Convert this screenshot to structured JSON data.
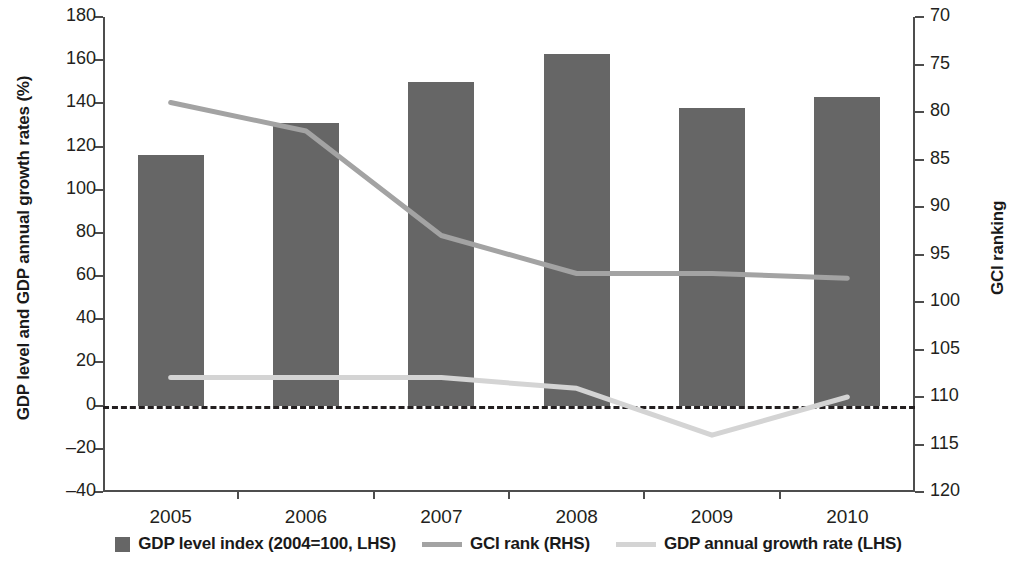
{
  "chart_data": {
    "type": "bar",
    "title": "",
    "subtitle": "",
    "categories": [
      "2005",
      "2006",
      "2007",
      "2008",
      "2009",
      "2010"
    ],
    "xlabel": "",
    "ylabel": "GDP level and GDP annual growth rates (%)",
    "y2label": "GCI ranking",
    "ylim": [
      -40,
      180
    ],
    "yticks": [
      -40,
      -20,
      0,
      20,
      40,
      60,
      80,
      100,
      120,
      140,
      160,
      180
    ],
    "ytick_labels": [
      "–40",
      "–20",
      "0",
      "20",
      "40",
      "60",
      "80",
      "100",
      "120",
      "140",
      "160",
      "180"
    ],
    "y2lim": [
      70,
      120
    ],
    "y2_inverted": true,
    "y2ticks": [
      70,
      75,
      80,
      85,
      90,
      95,
      100,
      105,
      110,
      115,
      120
    ],
    "y2tick_labels": [
      "70",
      "75",
      "80",
      "85",
      "90",
      "95",
      "100",
      "105",
      "110",
      "115",
      "120"
    ],
    "grid": false,
    "legend_position": "bottom",
    "zero_reference_line": true,
    "series": [
      {
        "name": "GDP level index (2004=100, LHS)",
        "type": "bar",
        "axis": "left",
        "color": "#666666",
        "values": [
          116,
          131,
          150,
          163,
          138,
          143
        ]
      },
      {
        "name": "GCI rank  (RHS)",
        "type": "line",
        "axis": "right",
        "color": "#a3a3a3",
        "values": [
          79,
          82,
          93,
          97,
          97,
          97.5
        ]
      },
      {
        "name": "GDP annual growth rate  (LHS)",
        "type": "line",
        "axis": "left",
        "color": "#d4d4d4",
        "values": [
          13,
          13,
          13,
          8,
          -13.7,
          4
        ]
      }
    ]
  },
  "legend": {
    "items": [
      {
        "label": "GDP level index (2004=100, LHS)",
        "marker": "square-swatch-icon",
        "color": "#666666"
      },
      {
        "label": "GCI rank  (RHS)",
        "marker": "line-swatch-icon",
        "color": "#a3a3a3"
      },
      {
        "label": "GDP annual growth rate  (LHS)",
        "marker": "line-swatch-icon",
        "color": "#d4d4d4"
      }
    ]
  },
  "axes": {
    "left_title": "GDP level and GDP annual growth rates (%)",
    "right_title": "GCI ranking"
  }
}
